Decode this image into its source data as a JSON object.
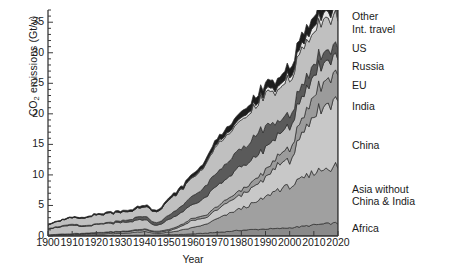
{
  "chart_data": {
    "type": "area",
    "stacked": true,
    "title": "",
    "xlabel": "Year",
    "ylabel": "CO2 emissions (Gt/y)",
    "ylabel_display": "CO₂ emissions (Gt/y)",
    "xlim": [
      1900,
      2020
    ],
    "ylim": [
      0,
      37
    ],
    "yticks": [
      0,
      5,
      10,
      15,
      20,
      25,
      30,
      35
    ],
    "ytick_labels": [
      "0",
      "5",
      "10",
      "15",
      "20",
      "25",
      "30",
      "35"
    ],
    "y_minor_tick_step": 1,
    "xticks": [
      1900,
      1910,
      1920,
      1930,
      1940,
      1950,
      1960,
      1970,
      1980,
      1990,
      2000,
      2010,
      2020
    ],
    "xtick_labels": [
      "1900",
      "1910",
      "1920",
      "1930",
      "1940",
      "1950",
      "1960",
      "1970",
      "1980",
      "1990",
      "2000",
      "2010",
      "2020"
    ],
    "grid": false,
    "legend_position": "right-outside-stack-order",
    "x": [
      1900,
      1905,
      1910,
      1915,
      1920,
      1925,
      1930,
      1935,
      1940,
      1945,
      1950,
      1955,
      1960,
      1965,
      1970,
      1975,
      1980,
      1985,
      1990,
      1995,
      2000,
      2005,
      2010,
      2015,
      2019,
      2020
    ],
    "series": [
      {
        "name": "Africa",
        "color": "#8a8a8a",
        "order": 1,
        "values": [
          0.02,
          0.03,
          0.04,
          0.05,
          0.06,
          0.08,
          0.09,
          0.11,
          0.14,
          0.15,
          0.2,
          0.25,
          0.35,
          0.45,
          0.6,
          0.75,
          0.95,
          1.05,
          1.15,
          1.2,
          1.35,
          1.55,
          1.8,
          2.0,
          2.1,
          2.0
        ]
      },
      {
        "name": "Asia without China & India",
        "color": "#a0a0a0",
        "order": 2,
        "values": [
          0.08,
          0.12,
          0.16,
          0.2,
          0.25,
          0.3,
          0.35,
          0.45,
          0.6,
          0.25,
          0.4,
          0.7,
          1.0,
          1.4,
          2.2,
          2.9,
          3.6,
          4.2,
          5.2,
          6.4,
          6.8,
          7.6,
          8.6,
          9.1,
          9.4,
          8.9
        ]
      },
      {
        "name": "China",
        "color": "#c8c8c8",
        "order": 3,
        "values": [
          0.07,
          0.09,
          0.11,
          0.13,
          0.16,
          0.2,
          0.22,
          0.25,
          0.3,
          0.2,
          0.25,
          0.6,
          1.2,
          1.0,
          1.5,
          1.9,
          2.3,
          2.6,
          3.1,
          4.0,
          4.4,
          7.0,
          9.5,
          10.5,
          11.0,
          11.3
        ]
      },
      {
        "name": "India",
        "color": "#9b9b9b",
        "order": 4,
        "values": [
          0.04,
          0.05,
          0.06,
          0.07,
          0.08,
          0.09,
          0.1,
          0.11,
          0.13,
          0.14,
          0.2,
          0.25,
          0.32,
          0.4,
          0.5,
          0.6,
          0.8,
          0.95,
          1.2,
          1.5,
          1.9,
          2.4,
          3.2,
          4.1,
          4.6,
          4.3
        ]
      },
      {
        "name": "EU",
        "color": "#bebebe",
        "order": 5,
        "values": [
          1.0,
          1.2,
          1.35,
          1.1,
          1.3,
          1.4,
          1.4,
          1.45,
          1.6,
          0.9,
          1.6,
          2.0,
          2.4,
          2.8,
          3.4,
          3.5,
          3.8,
          3.7,
          3.7,
          3.5,
          3.5,
          3.6,
          3.4,
          3.1,
          2.9,
          2.7
        ]
      },
      {
        "name": "Russia",
        "color": "#5a5a5a",
        "order": 6,
        "values": [
          0.08,
          0.11,
          0.14,
          0.12,
          0.06,
          0.12,
          0.25,
          0.4,
          0.55,
          0.4,
          0.7,
          1.0,
          1.4,
          1.8,
          2.2,
          2.6,
          3.0,
          3.3,
          3.6,
          2.1,
          1.9,
          1.9,
          1.8,
          1.8,
          1.8,
          1.7
        ]
      },
      {
        "name": "US",
        "color": "#c0c0c0",
        "order": 7,
        "values": [
          0.65,
          0.9,
          1.1,
          1.2,
          1.5,
          1.5,
          1.5,
          1.3,
          1.6,
          1.9,
          2.4,
          2.7,
          3.0,
          3.5,
          4.4,
          4.6,
          4.9,
          4.7,
          5.0,
          5.3,
          5.8,
          5.9,
          5.5,
          5.1,
          4.9,
          4.4
        ]
      },
      {
        "name": "Int. travel",
        "color": "#e6e6e6",
        "order": 8,
        "values": [
          0.0,
          0.0,
          0.0,
          0.0,
          0.01,
          0.01,
          0.02,
          0.02,
          0.03,
          0.02,
          0.05,
          0.08,
          0.12,
          0.18,
          0.3,
          0.35,
          0.4,
          0.42,
          0.5,
          0.55,
          0.65,
          0.8,
          0.95,
          1.05,
          1.1,
          0.6
        ]
      },
      {
        "name": "Other",
        "color": "#1c1c1c",
        "order": 9,
        "values": [
          0.06,
          0.08,
          0.1,
          0.12,
          0.14,
          0.17,
          0.2,
          0.22,
          0.25,
          0.2,
          0.3,
          0.4,
          0.5,
          0.6,
          0.8,
          0.9,
          1.0,
          1.1,
          1.2,
          1.3,
          1.4,
          1.5,
          1.6,
          1.7,
          1.75,
          1.6
        ]
      }
    ],
    "totals": [
      2.0,
      2.58,
      3.06,
      2.99,
      3.56,
      3.87,
      4.13,
      4.31,
      5.2,
      4.16,
      6.1,
      8.08,
      10.71,
      12.13,
      15.9,
      18.1,
      20.75,
      22.02,
      24.65,
      25.85,
      27.7,
      32.25,
      36.35,
      38.45,
      39.55,
      37.5
    ],
    "note": "Stacked from bottom: Africa, Asia without China & India, China, India, EU, Russia, US, Int. travel, Other"
  },
  "legend": {
    "items": [
      {
        "label": "Other",
        "top": 11
      },
      {
        "label": "Int. travel",
        "top": 24
      },
      {
        "label": "US",
        "top": 43
      },
      {
        "label": "Russia",
        "top": 61
      },
      {
        "label": "EU",
        "top": 80
      },
      {
        "label": "India",
        "top": 101
      },
      {
        "label": "China",
        "top": 140
      },
      {
        "label": "Asia without",
        "top": 184
      },
      {
        "label": "China & India",
        "top": 196
      },
      {
        "label": "Africa",
        "top": 223
      }
    ]
  }
}
